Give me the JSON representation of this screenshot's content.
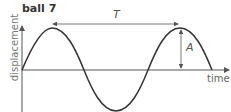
{
  "diagram": {
    "title": "ball 7",
    "y_axis_label": "displacement",
    "x_axis_label": "time",
    "period_label": "T",
    "amplitude_label": "A"
  },
  "colors": {
    "curve": "#333333",
    "axis": "#555555",
    "annotation": "#555555",
    "text": "#333333"
  }
}
